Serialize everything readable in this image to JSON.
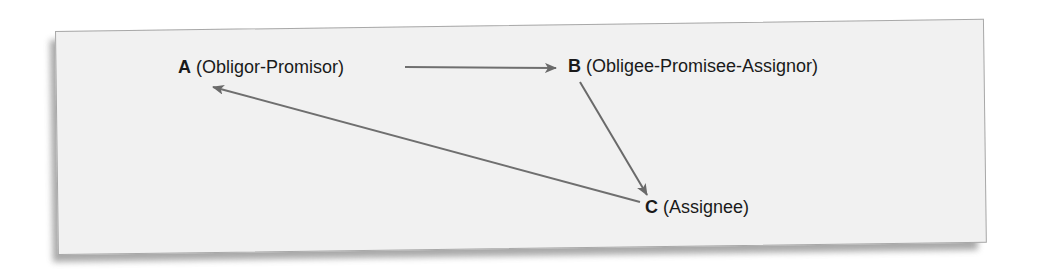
{
  "diagram": {
    "nodes": [
      {
        "id": "A",
        "letter": "A",
        "role": "(Obligor-Promisor)"
      },
      {
        "id": "B",
        "letter": "B",
        "role": "(Obligee-Promisee-Assignor)"
      },
      {
        "id": "C",
        "letter": "C",
        "role": "(Assignee)"
      }
    ],
    "edges": [
      {
        "from": "A",
        "to": "B",
        "color": "#6f6f6f"
      },
      {
        "from": "B",
        "to": "C",
        "color": "#6a6a6a"
      },
      {
        "from": "C",
        "to": "A",
        "color": "#6f6f6f"
      }
    ],
    "colors": {
      "panel_background": "#f1f1f1",
      "panel_border": "#a8a8a8",
      "text": "#1a1a1a",
      "arrow": "#6f6f6f"
    }
  }
}
